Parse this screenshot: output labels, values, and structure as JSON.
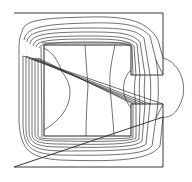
{
  "diagram": {
    "type": "contour-field-plot",
    "colors": {
      "background": "#ffffff",
      "lines": "#333333",
      "boundary": "#222222"
    },
    "outer_boundary": {
      "x": 14,
      "y": 13,
      "w": 149,
      "h": 154
    },
    "inner_window": {
      "x": 44,
      "y": 45,
      "w": 87,
      "h": 91
    },
    "gap": {
      "x": 131,
      "y": 75,
      "w": 32,
      "h": 29
    }
  }
}
